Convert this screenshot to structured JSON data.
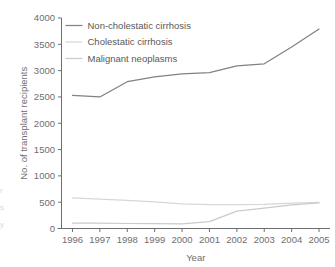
{
  "chart_data": {
    "type": "line",
    "title": "",
    "xlabel": "Year",
    "ylabel": "No. of transplant recipients",
    "categories": [
      1996,
      1997,
      1998,
      1999,
      2000,
      2001,
      2002,
      2003,
      2004,
      2005
    ],
    "x_tick_labels": [
      "1996",
      "1997",
      "1998",
      "1999",
      "2000",
      "2001",
      "2002",
      "2003",
      "2004",
      "2005"
    ],
    "y_tick_labels": [
      "0",
      "500",
      "1000",
      "1500",
      "2000",
      "2500",
      "3000",
      "3500",
      "4000"
    ],
    "y_ticks": [
      0,
      500,
      1000,
      1500,
      2000,
      2500,
      3000,
      3500,
      4000
    ],
    "ylim": [
      0,
      4000
    ],
    "xlim": [
      1995.6,
      2005.4
    ],
    "grid": false,
    "legend_position": "top-left-inside",
    "series": [
      {
        "name": "Non-cholestatic cirrhosis",
        "color": "#808285",
        "values": [
          2530,
          2500,
          2790,
          2880,
          2940,
          2960,
          3090,
          3130,
          3450,
          3790
        ]
      },
      {
        "name": "Cholestatic cirrhosis",
        "color": "#d6d7d9",
        "values": [
          580,
          560,
          535,
          505,
          470,
          455,
          455,
          460,
          480,
          495
        ]
      },
      {
        "name": "Malignant neoplasms",
        "color": "#c9cacc",
        "values": [
          100,
          100,
          95,
          95,
          90,
          130,
          330,
          385,
          450,
          485
        ]
      }
    ]
  },
  "axis": {
    "x_title": "Year",
    "y_title": "No. of transplant recipients"
  },
  "colors": {
    "axis": "#6d6e70",
    "text": "#58585a",
    "background": "#ffffff"
  }
}
